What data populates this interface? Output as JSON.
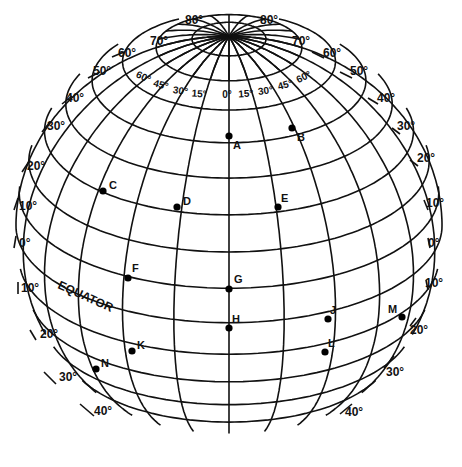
{
  "diagram": {
    "equator_label": "EQUATOR",
    "colors": {
      "ink": "#111111",
      "background": "#ffffff"
    },
    "latitude_labels": {
      "left": [
        {
          "text": "80°",
          "x": 185,
          "y": 24
        },
        {
          "text": "70°",
          "x": 150,
          "y": 45
        },
        {
          "text": "60°",
          "x": 118,
          "y": 57
        },
        {
          "text": "50°",
          "x": 93,
          "y": 75
        },
        {
          "text": "40°",
          "x": 66,
          "y": 102
        },
        {
          "text": "30°",
          "x": 47,
          "y": 130
        },
        {
          "text": "20°",
          "x": 27,
          "y": 170
        },
        {
          "text": "10°",
          "x": 19,
          "y": 210
        },
        {
          "text": "0°",
          "x": 19,
          "y": 247
        },
        {
          "text": "10°",
          "x": 21,
          "y": 292
        },
        {
          "text": "20°",
          "x": 40,
          "y": 338
        },
        {
          "text": "30°",
          "x": 59,
          "y": 381
        },
        {
          "text": "40°",
          "x": 94,
          "y": 415
        }
      ],
      "right": [
        {
          "text": "80°",
          "x": 260,
          "y": 24
        },
        {
          "text": "70°",
          "x": 292,
          "y": 45
        },
        {
          "text": "60°",
          "x": 323,
          "y": 57
        },
        {
          "text": "50°",
          "x": 350,
          "y": 75
        },
        {
          "text": "40°",
          "x": 377,
          "y": 102
        },
        {
          "text": "30°",
          "x": 397,
          "y": 130
        },
        {
          "text": "20°",
          "x": 417,
          "y": 162
        },
        {
          "text": "10°",
          "x": 426,
          "y": 207
        },
        {
          "text": "0°",
          "x": 428,
          "y": 247
        },
        {
          "text": "10°",
          "x": 425,
          "y": 287
        },
        {
          "text": "20°",
          "x": 410,
          "y": 334
        },
        {
          "text": "30°",
          "x": 386,
          "y": 376
        },
        {
          "text": "40°",
          "x": 345,
          "y": 416
        }
      ]
    },
    "longitude_labels": [
      {
        "text": "60°",
        "x": 142,
        "y": 80,
        "rot": 25
      },
      {
        "text": "45°",
        "x": 160,
        "y": 88,
        "rot": 15
      },
      {
        "text": "30°",
        "x": 180,
        "y": 94,
        "rot": 8
      },
      {
        "text": "15°",
        "x": 199,
        "y": 97,
        "rot": 3
      },
      {
        "text": "0°",
        "x": 227,
        "y": 98,
        "rot": 0
      },
      {
        "text": "15°",
        "x": 246,
        "y": 97,
        "rot": -3
      },
      {
        "text": "30°",
        "x": 266,
        "y": 94,
        "rot": -8
      },
      {
        "text": "45°",
        "x": 286,
        "y": 88,
        "rot": -15
      },
      {
        "text": "60°",
        "x": 305,
        "y": 80,
        "rot": -25
      }
    ],
    "points": [
      {
        "label": "A",
        "x": 229,
        "y": 136,
        "lx": 4,
        "ly": 13
      },
      {
        "label": "B",
        "x": 292,
        "y": 128,
        "lx": 5,
        "ly": 13
      },
      {
        "label": "C",
        "x": 103,
        "y": 191,
        "lx": 6,
        "ly": -2
      },
      {
        "label": "D",
        "x": 177,
        "y": 207,
        "lx": 6,
        "ly": -2
      },
      {
        "label": "E",
        "x": 278,
        "y": 207,
        "lx": 3,
        "ly": -5
      },
      {
        "label": "F",
        "x": 128,
        "y": 278,
        "lx": 4,
        "ly": -6
      },
      {
        "label": "G",
        "x": 229,
        "y": 289,
        "lx": 5,
        "ly": -6
      },
      {
        "label": "H",
        "x": 229,
        "y": 328,
        "lx": 3,
        "ly": -5
      },
      {
        "label": "J",
        "x": 328,
        "y": 319,
        "lx": 2,
        "ly": -5
      },
      {
        "label": "K",
        "x": 132,
        "y": 351,
        "lx": 5,
        "ly": -2
      },
      {
        "label": "L",
        "x": 325,
        "y": 352,
        "lx": 3,
        "ly": -5
      },
      {
        "label": "M",
        "x": 402,
        "y": 317,
        "lx": -14,
        "ly": -4
      },
      {
        "label": "N",
        "x": 96,
        "y": 369,
        "lx": 5,
        "ly": -2
      }
    ]
  }
}
